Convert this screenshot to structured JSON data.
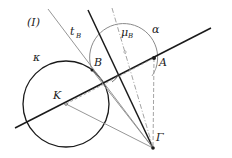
{
  "figure": {
    "panel_label": "(I)",
    "colors": {
      "ink": "#1a1a1a",
      "thin": "#8a8a8a",
      "dashed": "#9a9a9a",
      "background": "#ffffff"
    }
  },
  "labels": {
    "circle_kappa": "κ",
    "circle_alpha": "α",
    "tangent_t": "t",
    "tangent_sub": "B",
    "bisector_mu": "μ",
    "bisector_sub": "B",
    "point_A": "A",
    "point_B": "B",
    "point_K": "K",
    "point_Gamma": "Γ"
  },
  "geometry": {
    "K": [
      66,
      104
    ],
    "A": [
      154,
      58
    ],
    "B": [
      92,
      70
    ],
    "Gamma": [
      153,
      148
    ],
    "circle_kappa": {
      "cx": 66,
      "cy": 104,
      "r": 43
    },
    "circle_alpha": {
      "cx": 125,
      "cy": 55,
      "r": 34
    }
  }
}
